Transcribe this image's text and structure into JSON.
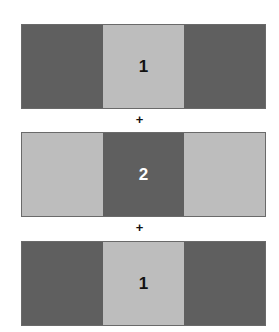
{
  "diagram": {
    "colors": {
      "dark": "#5f5f5f",
      "light": "#bdbdbd"
    },
    "bands": [
      {
        "cells": [
          {
            "shade": "dark",
            "label": ""
          },
          {
            "shade": "light",
            "label": "1"
          },
          {
            "shade": "dark",
            "label": ""
          }
        ]
      },
      {
        "cells": [
          {
            "shade": "light",
            "label": ""
          },
          {
            "shade": "dark",
            "label": "2"
          },
          {
            "shade": "light",
            "label": ""
          }
        ]
      },
      {
        "cells": [
          {
            "shade": "dark",
            "label": ""
          },
          {
            "shade": "light",
            "label": "1"
          },
          {
            "shade": "dark",
            "label": ""
          }
        ]
      }
    ],
    "operators": [
      "+",
      "+"
    ]
  }
}
